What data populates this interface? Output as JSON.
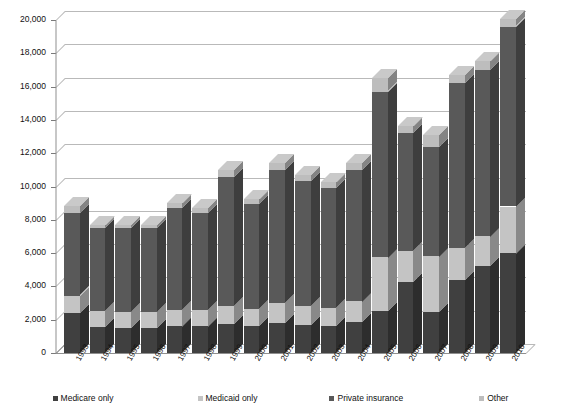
{
  "chart_data": {
    "type": "bar",
    "title": "",
    "xlabel": "",
    "ylabel": "",
    "ylim": [
      0,
      20000
    ],
    "ytick_step": 2000,
    "grid": true,
    "stacked": true,
    "three_d": true,
    "legend_position": "bottom",
    "ytick_labels": [
      "20,000",
      "18,000",
      "16,000",
      "14,000",
      "12,000",
      "10,000",
      "8,000",
      "6,000",
      "4,000",
      "2,000",
      "0"
    ],
    "categories": [
      "1993",
      "1994",
      "1995",
      "1996",
      "1997",
      "1998",
      "1999",
      "2000",
      "2001",
      "2002",
      "2003",
      "2004",
      "2005",
      "2006",
      "2007",
      "2008",
      "2009",
      "2010"
    ],
    "series": [
      {
        "name": "Medicare only",
        "color": "#404040",
        "values": [
          2400,
          1550,
          1500,
          1500,
          1600,
          1600,
          1750,
          1650,
          1800,
          1700,
          1600,
          1850,
          2500,
          4250,
          2450,
          4400,
          5200,
          6000
        ]
      },
      {
        "name": "Medicaid only",
        "color": "#c4c4c4",
        "values": [
          1050,
          950,
          950,
          950,
          1000,
          1000,
          1100,
          1000,
          1200,
          1150,
          1100,
          1250,
          3250,
          1850,
          3350,
          1900,
          1800,
          2800
        ]
      },
      {
        "name": "Private insurance",
        "color": "#595959",
        "values": [
          4950,
          5000,
          5050,
          5050,
          6100,
          5800,
          7750,
          6300,
          8000,
          7500,
          7200,
          7900,
          9950,
          7100,
          6600,
          9900,
          10000,
          10800
        ]
      },
      {
        "name": "Other",
        "color": "#bdbdbd",
        "values": [
          400,
          200,
          200,
          200,
          300,
          300,
          400,
          300,
          400,
          350,
          350,
          400,
          800,
          450,
          700,
          500,
          550,
          450
        ]
      }
    ],
    "totals": [
      8800,
      7700,
      7700,
      7700,
      9000,
      8700,
      11000,
      9250,
      11400,
      10700,
      10250,
      11400,
      16500,
      13650,
      13100,
      16700,
      17550,
      20050
    ]
  },
  "legend": {
    "items": [
      {
        "label": "Medicare only"
      },
      {
        "label": "Medicaid only"
      },
      {
        "label": "Private insurance"
      },
      {
        "label": "Other"
      }
    ]
  }
}
